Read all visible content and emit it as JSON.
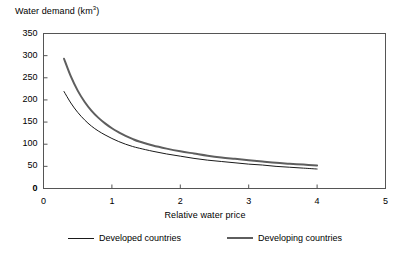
{
  "chart_data": {
    "type": "line",
    "title": "",
    "ylabel": "Water demand (km³)",
    "ylabel_base": "Water demand (km",
    "ylabel_sup": "3",
    "ylabel_close": ")",
    "xlabel": "Relative water price",
    "xlim": [
      0,
      5
    ],
    "ylim": [
      0,
      350
    ],
    "xticks": [
      "0",
      "1",
      "2",
      "3",
      "4",
      "5"
    ],
    "yticks": [
      "0",
      "50",
      "100",
      "150",
      "200",
      "250",
      "300",
      "350"
    ],
    "grid": false,
    "legend_position": "bottom",
    "series": [
      {
        "name": "Developed countries",
        "color": "#1a1a1a",
        "width": 1,
        "x": [
          0.3,
          0.4,
          0.5,
          0.6,
          0.7,
          0.8,
          0.9,
          1.0,
          1.1,
          1.2,
          1.3,
          1.4,
          1.6,
          1.8,
          2.0,
          2.2,
          2.4,
          2.6,
          2.8,
          3.0,
          3.2,
          3.4,
          3.6,
          3.8,
          4.0
        ],
        "y": [
          219,
          193,
          172,
          155,
          141,
          130,
          121,
          113,
          106,
          100,
          95,
          91,
          84,
          78,
          73,
          68,
          64,
          61,
          58,
          55,
          53,
          50,
          48,
          46,
          44
        ]
      },
      {
        "name": "Developing countries",
        "color": "#5e5e5e",
        "width": 2,
        "x": [
          0.3,
          0.4,
          0.5,
          0.6,
          0.7,
          0.8,
          0.9,
          1.0,
          1.1,
          1.2,
          1.3,
          1.4,
          1.6,
          1.8,
          2.0,
          2.2,
          2.4,
          2.6,
          2.8,
          3.0,
          3.2,
          3.4,
          3.6,
          3.8,
          4.0
        ],
        "y": [
          293,
          253,
          221,
          196,
          176,
          160,
          147,
          136,
          127,
          119,
          112,
          106,
          97,
          90,
          84,
          79,
          74,
          70,
          67,
          64,
          61,
          58,
          56,
          54,
          52
        ]
      }
    ]
  },
  "legend": {
    "items": [
      {
        "label": "Developed countries"
      },
      {
        "label": "Developing countries"
      }
    ]
  },
  "colors": {
    "developed": "#1a1a1a",
    "developing": "#5e5e5e",
    "axis": "#555555",
    "background": "#ffffff"
  }
}
